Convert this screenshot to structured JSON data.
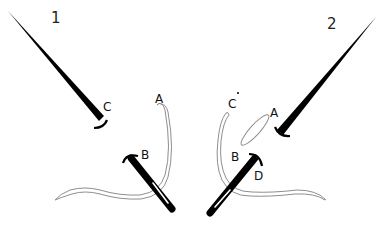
{
  "diagram": {
    "background": "#ffffff",
    "ink_color": "#000000",
    "thread_color": "#9a9a9a",
    "panels": [
      {
        "step_label": "1",
        "points": {
          "A": "A",
          "B": "B",
          "C": "C"
        }
      },
      {
        "step_label": "2",
        "points": {
          "A": "A",
          "B": "B",
          "C": "C",
          "D": "D"
        }
      }
    ]
  }
}
